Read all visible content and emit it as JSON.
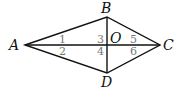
{
  "diagram": {
    "type": "kite / quadrilateral with diagonals",
    "points": {
      "A": "A",
      "B": "B",
      "C": "C",
      "D": "D",
      "O": "O"
    },
    "angles": [
      "1",
      "2",
      "3",
      "4",
      "5",
      "6"
    ],
    "segments": [
      "AB",
      "BC",
      "CD",
      "DA",
      "AC",
      "BD"
    ]
  }
}
